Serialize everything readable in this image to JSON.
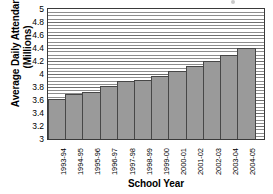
{
  "chart_data": {
    "type": "bar",
    "title": "",
    "xlabel": "School Year",
    "ylabel": "Average Daily Attendance (Millions)",
    "ylabel_line1": "Average Daily Attendance",
    "ylabel_line2": "(Millions)",
    "categories": [
      "1993-94",
      "1994-95",
      "1995-96",
      "1996-97",
      "1997-98",
      "1998-99",
      "1999-00",
      "2000-01",
      "2001-02",
      "2002-03",
      "2003-04",
      "2004-05"
    ],
    "values": [
      3.62,
      3.7,
      3.72,
      3.82,
      3.89,
      3.91,
      3.97,
      4.05,
      4.13,
      4.2,
      4.3,
      4.4
    ],
    "ylim": [
      3,
      5
    ],
    "ytick_labels": [
      "5",
      "4.8",
      "4.6",
      "4.4",
      "4.2",
      "4",
      "3.8",
      "3.6",
      "3.4",
      "3.2",
      "3"
    ],
    "ytick_values": [
      5,
      4.8,
      4.6,
      4.4,
      4.2,
      4,
      3.8,
      3.6,
      3.4,
      3.2,
      3
    ],
    "minor_gridline_step": 0.05,
    "grid": true,
    "legend": false,
    "legend_position": "none",
    "bar_color": "#9a9a9a",
    "bar_border_color": "#474747",
    "gridline_color": "#8d8d8d",
    "axis_color": "#3a3a3a"
  }
}
